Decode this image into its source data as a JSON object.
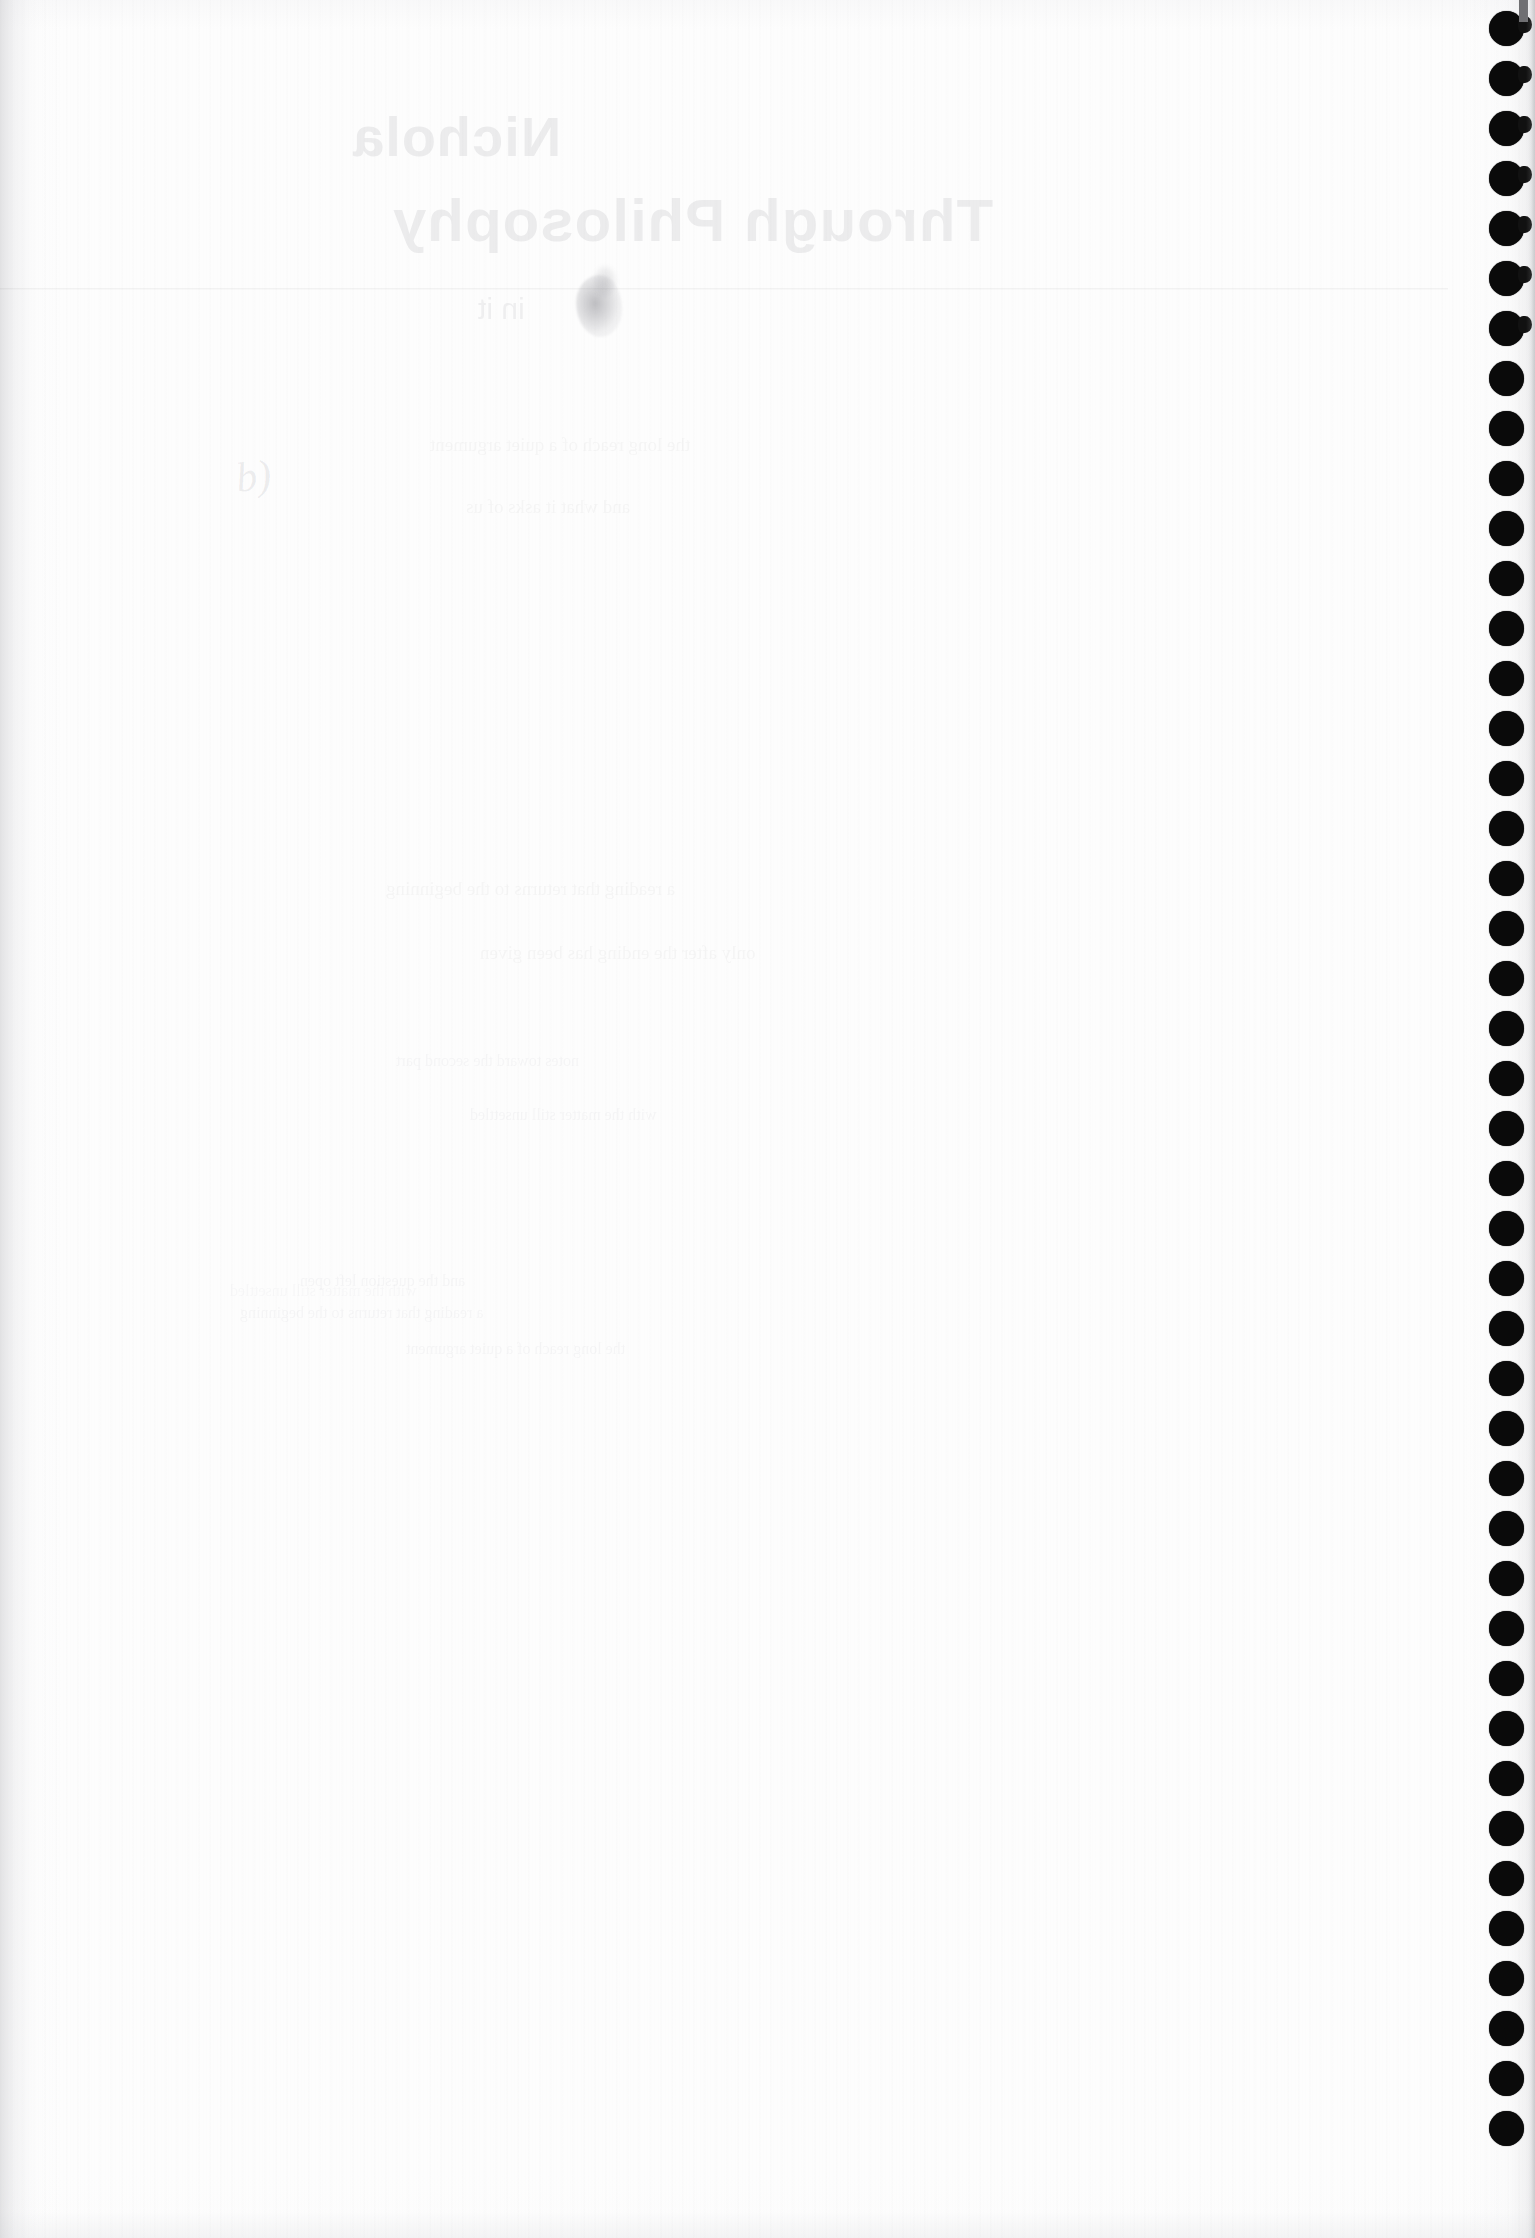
{
  "document": {
    "kind": "scanned-page",
    "page_side": "blank-verso",
    "width_px": 1535,
    "height_px": 2238,
    "paper_color": "#fdfdfd",
    "binding_color": "#0a0a0a"
  },
  "show_through": {
    "note": "mirrored text bleeding through from the printed front side",
    "title_line_1": "Nichola",
    "title_line_2": "Through Philosophy",
    "subtitle": "in it",
    "body_block_1": [
      "the long reach of a quiet argument",
      "and what it asks of us"
    ],
    "body_block_2": [
      "a reading that returns to the beginning",
      "only after the ending has been given"
    ],
    "body_block_3": [
      "notes toward the second part",
      "with the matter still unsettled",
      "and the question left open"
    ]
  },
  "marks": {
    "pencil_scribble": "b)",
    "ink_smudge": "ink-blot",
    "scan_seam": "horizontal-scanner-seam"
  },
  "binding": {
    "type": "spiral-bound-punch-holes",
    "edge": "right",
    "hole_count": 43,
    "hole_diameter_px": 35,
    "hole_spacing_px": 50,
    "center_x_px": 1506,
    "first_center_y_px": 28
  }
}
